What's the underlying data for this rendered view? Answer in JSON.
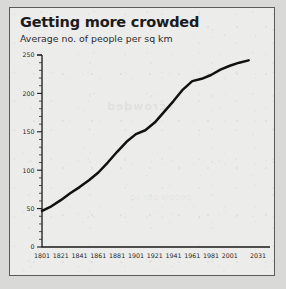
{
  "panel": {
    "title": "Getting more crowded",
    "subtitle": "Average no. of people per sq km",
    "ghost_text_1": "crowded",
    "ghost_text_2": "people per sq"
  },
  "chart_data": {
    "type": "line",
    "title": "Getting more crowded",
    "subtitle": "Average no. of people per sq km",
    "xlabel": "",
    "ylabel": "Average no. of people per sq km",
    "xlim": [
      1801,
      2031
    ],
    "ylim": [
      0,
      250
    ],
    "grid": false,
    "legend": null,
    "y_ticks": [
      0,
      50,
      100,
      150,
      200,
      250
    ],
    "y_tick_labels": [
      "0",
      "50",
      "100",
      "150",
      "200",
      "250"
    ],
    "y_minor_step": 10,
    "x_ticks": [
      1801,
      1821,
      1841,
      1861,
      1881,
      1901,
      1921,
      1941,
      1961,
      1981,
      2001,
      2031
    ],
    "x_tick_labels": [
      "1801",
      "1821",
      "1841",
      "1861",
      "1881",
      "1901",
      "1921",
      "1941",
      "1961",
      "1981",
      "2001",
      "2031"
    ],
    "line_color": "#111111",
    "x": [
      1801,
      1811,
      1821,
      1831,
      1841,
      1851,
      1861,
      1871,
      1881,
      1891,
      1901,
      1911,
      1921,
      1931,
      1941,
      1951,
      1961,
      1971,
      1981,
      1991,
      2001,
      2011,
      2021
    ],
    "values": [
      47,
      53,
      61,
      70,
      78,
      87,
      97,
      110,
      124,
      137,
      147,
      152,
      162,
      176,
      190,
      205,
      216,
      219,
      224,
      231,
      236,
      240,
      243
    ],
    "series": [
      {
        "name": "Average no. of people per sq km",
        "values": [
          47,
          53,
          61,
          70,
          78,
          87,
          97,
          110,
          124,
          137,
          147,
          152,
          162,
          176,
          190,
          205,
          216,
          219,
          224,
          231,
          236,
          240,
          243
        ]
      }
    ]
  }
}
